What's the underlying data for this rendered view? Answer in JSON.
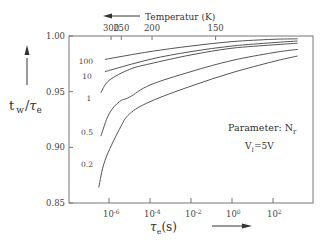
{
  "chart_data": {
    "type": "line",
    "title": "",
    "xlabel": "τe(s)",
    "ylabel": "tw/τe",
    "x_scale": "log",
    "xlim_log10": [
      -7,
      4
    ],
    "ylim": [
      0.85,
      1.0
    ],
    "y_ticks": [
      "1.00",
      "0.95",
      "0.90",
      "0.85"
    ],
    "y_tick_values": [
      1.0,
      0.95,
      0.9,
      0.85
    ],
    "x_ticks": [
      "10^-6",
      "10^-4",
      "10^-2",
      "10^0",
      "10^2"
    ],
    "x_tick_log10": [
      -6,
      -4,
      -2,
      0,
      2
    ],
    "top_axis": {
      "label": "Temperatur (K)",
      "arrow_direction": "left",
      "ticks": [
        "300",
        "250",
        "200",
        "150"
      ],
      "tick_log10_positions": [
        -5.9,
        -5.4,
        -3.9,
        -0.8
      ]
    },
    "x_arrow_direction": "right",
    "grid": false,
    "legend": null,
    "annotations": [
      "Parameter: Nr",
      "VI=5V"
    ],
    "series": [
      {
        "name": "100",
        "log10_x": [
          -6.2,
          -4,
          -2,
          0,
          2,
          3.2
        ],
        "y": [
          0.979,
          0.986,
          0.991,
          0.995,
          0.997,
          0.9975
        ]
      },
      {
        "name": "10",
        "log10_x": [
          -6.2,
          -4,
          -2,
          0,
          2,
          3.2
        ],
        "y": [
          0.968,
          0.979,
          0.986,
          0.991,
          0.994,
          0.9955
        ]
      },
      {
        "name": "1",
        "log10_x": [
          -6.4,
          -6,
          -5,
          -4,
          -2,
          0,
          2,
          3.2
        ],
        "y": [
          0.949,
          0.96,
          0.97,
          0.975,
          0.983,
          0.989,
          0.992,
          0.9935
        ]
      },
      {
        "name": "0.5",
        "log10_x": [
          -6.4,
          -6,
          -5.5,
          -5,
          -4,
          -2,
          0,
          2,
          3.2
        ],
        "y": [
          0.91,
          0.93,
          0.941,
          0.945,
          0.956,
          0.968,
          0.978,
          0.985,
          0.988
        ]
      },
      {
        "name": "0.2",
        "log10_x": [
          -6.5,
          -6.2,
          -5.5,
          -5,
          -4,
          -2,
          0,
          2,
          3.2
        ],
        "y": [
          0.864,
          0.888,
          0.916,
          0.93,
          0.941,
          0.955,
          0.967,
          0.977,
          0.982
        ]
      }
    ]
  },
  "labels": {
    "temperature": "Temperatur (K)",
    "parameter_text": "Parameter: N",
    "parameter_sub": "r",
    "voltage_main": "V",
    "voltage_sub": "I",
    "voltage_rest": "=5V",
    "ylabel_t": "t",
    "ylabel_w": "w",
    "ylabel_slash": "/",
    "ylabel_tau": "τ",
    "ylabel_e": "e",
    "xlabel_tau": "τ",
    "xlabel_e": "e",
    "xlabel_s": "(s)"
  },
  "curve_labels": [
    {
      "text": "100",
      "x": 86,
      "y": 64
    },
    {
      "text": "10",
      "x": 87,
      "y": 79
    },
    {
      "text": "1",
      "x": 89,
      "y": 101
    },
    {
      "text": "0.5",
      "x": 87,
      "y": 135
    },
    {
      "text": "0.2",
      "x": 87,
      "y": 167
    }
  ]
}
